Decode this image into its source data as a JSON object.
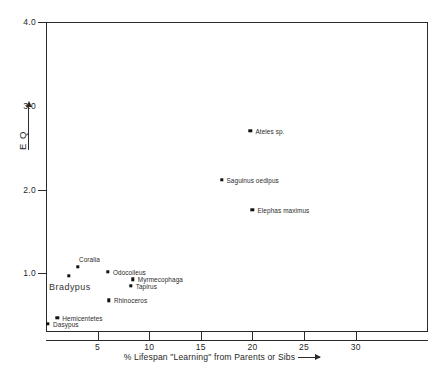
{
  "chart_data": {
    "type": "scatter",
    "title": "",
    "xlabel": "% Lifespan \"Learning\" from Parents or Sibs",
    "ylabel": "E Q",
    "xlim": [
      0,
      37
    ],
    "ylim": [
      0.3,
      4.0
    ],
    "xticks": [
      5,
      10,
      15,
      20,
      25,
      30
    ],
    "xtick_labels": [
      "5",
      "10",
      "15",
      "20",
      "25",
      "30"
    ],
    "yticks": [
      1.0,
      2.0,
      3.0,
      4.0
    ],
    "ytick_labels": [
      "1.0",
      "2.0",
      "3.0",
      "4.0"
    ],
    "grid": false,
    "legend": "none",
    "points": [
      {
        "label": "Ateles sp.",
        "x": 19.8,
        "y": 2.7,
        "label_side": "right",
        "label_size": "small"
      },
      {
        "label": "Saguinus oedipus",
        "x": 17.0,
        "y": 2.12,
        "label_side": "right",
        "label_size": "small"
      },
      {
        "label": "Elephas maximus",
        "x": 20.0,
        "y": 1.76,
        "label_side": "right",
        "label_size": "small"
      },
      {
        "label": "Coralia",
        "x": 3.1,
        "y": 1.08,
        "label_side": "above",
        "label_size": "small"
      },
      {
        "label": "Odocoileus",
        "x": 6.0,
        "y": 1.02,
        "label_side": "right",
        "label_size": "small"
      },
      {
        "label": "Bradypus",
        "x": 2.2,
        "y": 0.97,
        "label_side": "below",
        "label_size": "big"
      },
      {
        "label": "Myrmecophaga",
        "x": 8.4,
        "y": 0.93,
        "label_side": "right",
        "label_size": "small"
      },
      {
        "label": "Tapirus",
        "x": 8.2,
        "y": 0.85,
        "label_side": "right",
        "label_size": "small"
      },
      {
        "label": "Rhinoceros",
        "x": 6.1,
        "y": 0.68,
        "label_side": "right",
        "label_size": "small"
      },
      {
        "label": "Hemicentetes",
        "x": 1.1,
        "y": 0.47,
        "label_side": "right",
        "label_size": "small"
      },
      {
        "label": "Dasypus",
        "x": 0.2,
        "y": 0.4,
        "label_side": "right",
        "label_size": "small"
      }
    ]
  },
  "axes": {
    "y_axis_label": "E Q",
    "x_axis_label_prefix": "% Lifespan",
    "x_axis_label_quoted": "\"Learning\"",
    "x_axis_label_suffix": " from Parents or Sibs"
  },
  "caption": {
    "text": ""
  }
}
